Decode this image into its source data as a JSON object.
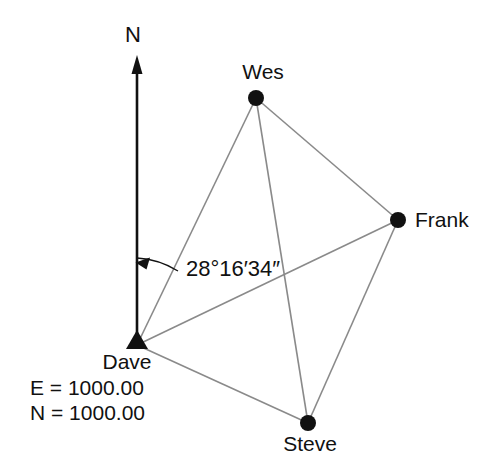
{
  "diagram": {
    "type": "survey-traverse-network",
    "north_label": "N",
    "angle_label": "28°16′34″",
    "angle_value": {
      "degrees": 28,
      "minutes": 16,
      "seconds": 34
    },
    "angle_from": "north",
    "angle_to": "Wes",
    "angle_vertex": "Dave",
    "colors": {
      "line": "#8a8a8a",
      "marker": "#111111",
      "text": "#111111",
      "background": "#ffffff"
    },
    "stations": [
      {
        "id": "wes",
        "label": "Wes",
        "marker": "circle",
        "x": 256,
        "y": 98
      },
      {
        "id": "frank",
        "label": "Frank",
        "marker": "circle",
        "x": 398,
        "y": 220
      },
      {
        "id": "steve",
        "label": "Steve",
        "marker": "circle",
        "x": 308,
        "y": 423
      },
      {
        "id": "dave",
        "label": "Dave",
        "marker": "triangle",
        "x": 137,
        "y": 345
      }
    ],
    "lines": [
      {
        "from": "dave",
        "to": "wes"
      },
      {
        "from": "dave",
        "to": "frank"
      },
      {
        "from": "dave",
        "to": "steve"
      },
      {
        "from": "wes",
        "to": "frank"
      },
      {
        "from": "wes",
        "to": "steve"
      },
      {
        "from": "frank",
        "to": "steve"
      }
    ],
    "dave_coordinates": {
      "easting_label": "E = 1000.00",
      "northing_label": "N = 1000.00",
      "easting": 1000.0,
      "northing": 1000.0
    }
  }
}
